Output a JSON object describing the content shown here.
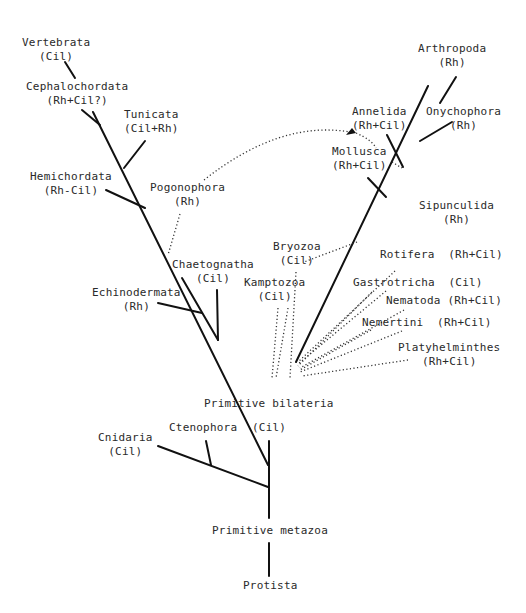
{
  "figure": {
    "type": "phylogenetic tree",
    "legend_codes": {
      "Rh": "rhabdomeric",
      "Cil": "ciliary"
    }
  },
  "taxa": {
    "vertebrata": {
      "name": "Vertebrata",
      "code": "(Cil)"
    },
    "cephalochordata": {
      "name": "Cephalochordata",
      "code": "(Rh+Cil?)"
    },
    "tunicata": {
      "name": "Tunicata",
      "code": "(Cil+Rh)"
    },
    "hemichordata": {
      "name": "Hemichordata",
      "code": "(Rh-Cil)"
    },
    "pogonophora": {
      "name": "Pogonophora",
      "code": "(Rh)"
    },
    "chaetognatha": {
      "name": "Chaetognatha",
      "code": "(Cil)"
    },
    "echinodermata": {
      "name": "Echinodermata",
      "code": "(Rh)"
    },
    "bryozoa": {
      "name": "Bryozoa",
      "code": "(Cil)"
    },
    "kamptozoa": {
      "name": "Kamptozoa",
      "code": "(Cil)"
    },
    "arthropoda": {
      "name": "Arthropoda",
      "code": "(Rh)"
    },
    "annelida": {
      "name": "Annelida",
      "code": "(Rh+Cil)"
    },
    "onychophora": {
      "name": "Onychophora",
      "code": "(Rh)"
    },
    "mollusca": {
      "name": "Mollusca",
      "code": "(Rh+Cil)"
    },
    "sipunculida": {
      "name": "Sipunculida",
      "code": "(Rh)"
    },
    "rotifera": {
      "name": "Rotifera",
      "code": "(Rh+Cil)"
    },
    "gastrotricha": {
      "name": "Gastrotricha",
      "code": "(Cil)"
    },
    "nematoda": {
      "name": "Nematoda",
      "code": "(Rh+Cil)"
    },
    "nemertini": {
      "name": "Nemertini",
      "code": "(Rh+Cil)"
    },
    "platyhelminthes": {
      "name": "Platyhelminthes",
      "code": "(Rh+Cil)"
    },
    "primitive_bilateria": {
      "name": "Primitive bilateria",
      "code": "(Cil)"
    },
    "cnidaria": {
      "name": "Cnidaria",
      "code": "(Cil)"
    },
    "ctenophora": {
      "name": "Ctenophora"
    },
    "primitive_metazoa": {
      "name": "Primitive metazoa"
    },
    "protista": {
      "name": "Protista"
    }
  }
}
